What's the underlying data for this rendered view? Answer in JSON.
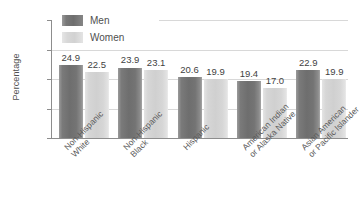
{
  "chart_data": {
    "type": "bar",
    "title": "",
    "subtitle": "",
    "xlabel": "",
    "ylabel": "Percentage",
    "ylim": [
      0,
      40
    ],
    "yticks": [
      0,
      10,
      20,
      30,
      40
    ],
    "ytick_labels": [
      "0",
      "10",
      "20",
      "30",
      "40"
    ],
    "grid": true,
    "grid_axis": "y",
    "legend_position": "top-left",
    "categories": [
      "Non-Hispanic White",
      "Non-Hispanic Black",
      "Hispanic",
      "American Indian or Alaska Native",
      "Asian American or Pacific Islander"
    ],
    "category_lines": [
      [
        "Non-Hispanic",
        "White"
      ],
      [
        "Non-Hispanic",
        "Black"
      ],
      [
        "Hispanic"
      ],
      [
        "American Indian",
        "or Alaska Native"
      ],
      [
        "Asian American",
        "or Pacific Islander"
      ]
    ],
    "series": [
      {
        "name": "Men",
        "color": "#6e6e6e",
        "values": [
          24.9,
          23.9,
          20.6,
          19.4,
          22.9
        ],
        "labels": [
          "24.9",
          "23.9",
          "20.6",
          "19.4",
          "22.9"
        ]
      },
      {
        "name": "Women",
        "color": "#d2d2d2",
        "values": [
          22.5,
          23.1,
          19.9,
          17.0,
          19.9
        ],
        "labels": [
          "22.5",
          "23.1",
          "19.9",
          "17.0",
          "19.9"
        ]
      }
    ]
  },
  "legend": {
    "items": [
      {
        "label": "Men"
      },
      {
        "label": "Women"
      }
    ]
  },
  "colors": {
    "men_bar": "#6e6e6e",
    "women_bar": "#d2d2d2",
    "axis": "#8d8d8d",
    "gridline": "#d8d8d8",
    "text": "#4f4f4f",
    "background": "#ffffff"
  }
}
